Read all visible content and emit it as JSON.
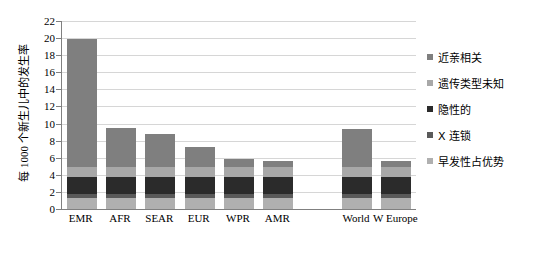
{
  "chart_data": {
    "type": "bar",
    "subtype": "stacked-bar",
    "title": "",
    "xlabel": "",
    "ylabel": "每 1000 个新生儿中的发生率",
    "ylim": [
      0,
      22
    ],
    "ytick_step": 2,
    "yticks": [
      "0",
      "2",
      "4",
      "6",
      "8",
      "10",
      "12",
      "14",
      "16",
      "18",
      "20",
      "22"
    ],
    "grid": true,
    "legend_position": "right",
    "categories": [
      "EMR",
      "AFR",
      "SEAR",
      "EUR",
      "WPR",
      "AMR",
      "",
      "World",
      "W Europe"
    ],
    "series": [
      {
        "name": "早发性占优势",
        "color": "#b0b0b0",
        "values": [
          1.3,
          1.3,
          1.3,
          1.3,
          1.3,
          1.3,
          0,
          1.3,
          1.3
        ]
      },
      {
        "name": "X 连锁",
        "color": "#5a5a5a",
        "values": [
          0.5,
          0.5,
          0.5,
          0.5,
          0.5,
          0.5,
          0,
          0.5,
          0.5
        ]
      },
      {
        "name": "隐性的",
        "color": "#2b2b2b",
        "values": [
          2.0,
          2.0,
          2.0,
          2.0,
          2.0,
          2.0,
          0,
          2.0,
          2.0
        ]
      },
      {
        "name": "遗传类型未知",
        "color": "#a8a8a8",
        "values": [
          1.1,
          1.1,
          1.1,
          1.1,
          1.1,
          1.1,
          0,
          1.1,
          1.1
        ]
      },
      {
        "name": "近亲相关",
        "color": "#7f7f7f",
        "values": [
          15.0,
          4.6,
          3.9,
          2.4,
          0.9,
          0.7,
          0,
          4.5,
          0.7
        ]
      }
    ],
    "totals": [
      19.9,
      9.5,
      8.8,
      7.3,
      5.8,
      5.6,
      0,
      9.4,
      5.6
    ]
  },
  "legend": {
    "items": [
      {
        "label": "近亲相关",
        "color": "#7f7f7f"
      },
      {
        "label": "遗传类型未知",
        "color": "#a8a8a8"
      },
      {
        "label": "隐性的",
        "color": "#2b2b2b"
      },
      {
        "label": "X 连锁",
        "color": "#5a5a5a"
      },
      {
        "label": "早发性占优势",
        "color": "#b0b0b0"
      }
    ]
  },
  "axis_colors": {
    "axis_line": "#808080",
    "gridline": "#d6d6d6",
    "background": "#ffffff"
  }
}
